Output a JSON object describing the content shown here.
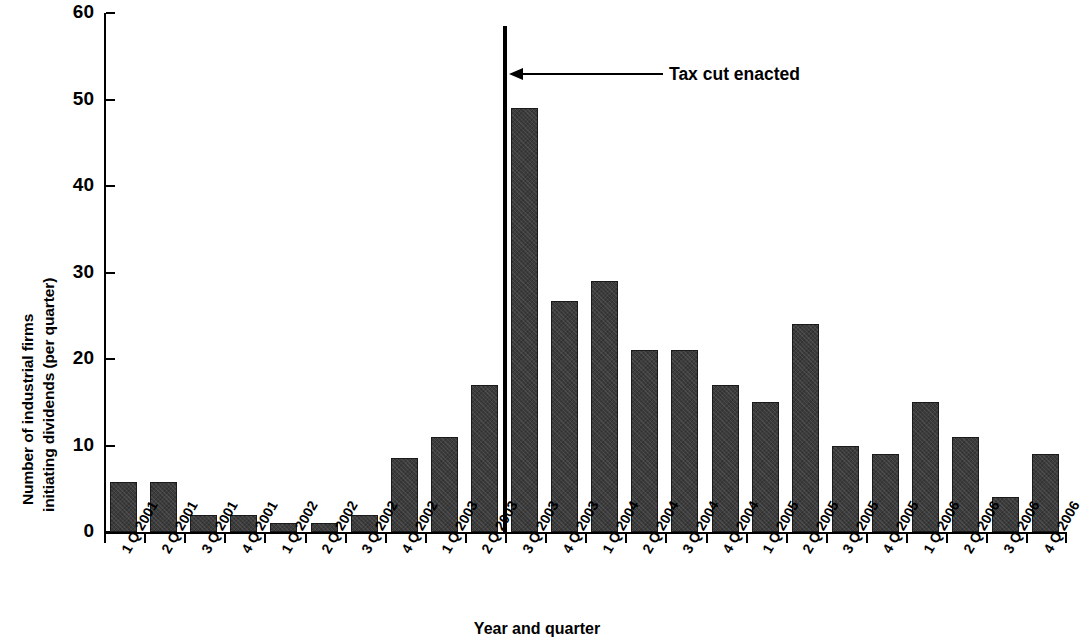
{
  "chart_data": {
    "type": "bar",
    "title": "",
    "subtitle": "",
    "xlabel": "Year and quarter",
    "ylabel": "Number of industrial firms initiating dividends (per quarter)",
    "ylabel_lines": [
      "Number of industrial firms",
      "initiating dividends (per quarter)"
    ],
    "categories": [
      "1 Q 2001",
      "2 Q 2001",
      "3 Q 2001",
      "4 Q 2001",
      "1 Q 2002",
      "2 Q 2002",
      "3 Q 2002",
      "4 Q 2002",
      "1 Q 2003",
      "2 Q 2003",
      "3 Q 2003",
      "4 Q 2003",
      "1 Q 2004",
      "2 Q 2004",
      "3 Q 2004",
      "4 Q 2004",
      "1 Q 2005",
      "2 Q 2005",
      "3 Q 2005",
      "4 Q 2005",
      "1 Q 2006",
      "2 Q 2006",
      "3 Q 2006",
      "4 Q 2006"
    ],
    "values": [
      5.8,
      5.8,
      2,
      2,
      1,
      1,
      2,
      8.6,
      11,
      17,
      49,
      26.7,
      29,
      21,
      21,
      17,
      15,
      24,
      10,
      9,
      15,
      11,
      4,
      9
    ],
    "ylim": [
      0,
      60
    ],
    "yticks": [
      0,
      10,
      20,
      30,
      40,
      50,
      60
    ],
    "ytick_labels": [
      "0",
      "10",
      "20",
      "30",
      "40",
      "50",
      "60"
    ],
    "grid": false,
    "legend": null,
    "bar_color": "#3c3c3c",
    "annotations": [
      {
        "label": "Tax cut enacted",
        "kind": "vertical-line-with-arrow",
        "at_category": "3 Q 2003",
        "line_value_top": 58.5
      }
    ]
  }
}
